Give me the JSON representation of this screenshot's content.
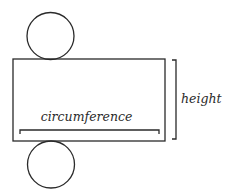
{
  "diagram": {
    "labels": {
      "circumference": "circumference",
      "height": "height"
    },
    "shapes": {
      "top_circle": {
        "cx": 50.5,
        "cy": 36,
        "r": 23.5
      },
      "rectangle": {
        "x": 13,
        "y": 59,
        "width": 152,
        "height": 82
      },
      "bottom_circle": {
        "cx": 51,
        "cy": 164.5,
        "r": 23.5
      },
      "circumference_bracket": {
        "x1": 20,
        "x2": 159,
        "y": 130,
        "tick": 4
      },
      "height_bracket": {
        "x": 176,
        "y1": 60,
        "y2": 139,
        "tick": 4
      }
    },
    "colors": {
      "stroke": "#2a2a2a",
      "background": "#ffffff"
    }
  }
}
